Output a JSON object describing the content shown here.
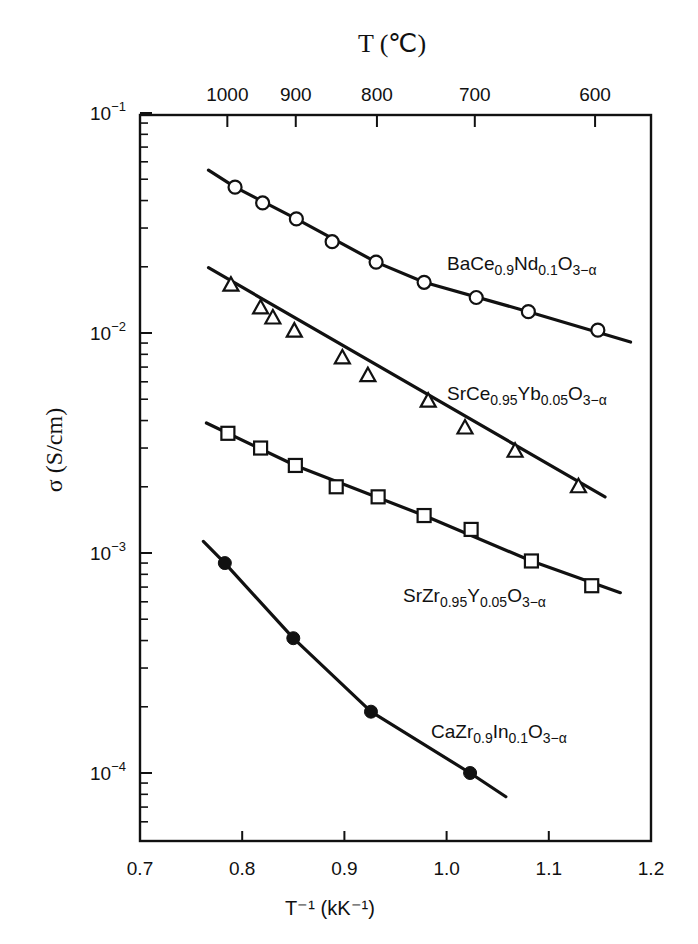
{
  "chart_data": {
    "type": "scatter",
    "title": "",
    "xlabel": "T⁻¹ (kK⁻¹)",
    "ylabel": "σ (S/cm)",
    "top_xlabel": "T (℃)",
    "xlim": [
      0.7,
      1.2
    ],
    "ylim": [
      5e-05,
      0.1
    ],
    "yscale": "log",
    "grid": false,
    "x_ticks": [
      0.7,
      0.8,
      0.9,
      1.0,
      1.1,
      1.2
    ],
    "x_tick_labels": [
      "0.7",
      "0.8",
      "0.9",
      "1.0",
      "1.1",
      "1.2"
    ],
    "y_ticks": [
      0.1,
      0.01,
      0.001,
      0.0001
    ],
    "y_tick_labels": [
      {
        "base": "10",
        "exp": "−1"
      },
      {
        "base": "10",
        "exp": "−2"
      },
      {
        "base": "10",
        "exp": "−3"
      },
      {
        "base": "10",
        "exp": "−4"
      }
    ],
    "top_ticks_celsius": [
      1000,
      900,
      800,
      700,
      600
    ],
    "top_tick_labels": [
      "1000",
      "900",
      "800",
      "700",
      "600"
    ],
    "series": [
      {
        "name": "BaCe0.9Nd0.1O3-α",
        "label_parts": [
          [
            "BaCe",
            ""
          ],
          [
            "0.9",
            "sub"
          ],
          [
            "Nd",
            ""
          ],
          [
            "0.1",
            "sub"
          ],
          [
            "O",
            ""
          ],
          [
            "3−α",
            "sub"
          ]
        ],
        "marker": "open-circle",
        "x": [
          0.793,
          0.82,
          0.853,
          0.888,
          0.931,
          0.978,
          1.029,
          1.08,
          1.148
        ],
        "y": [
          0.046,
          0.039,
          0.033,
          0.026,
          0.021,
          0.017,
          0.0145,
          0.0125,
          0.0103
        ],
        "line": [
          [
            0.767,
            0.055
          ],
          [
            0.793,
            0.046
          ],
          [
            0.853,
            0.033
          ],
          [
            0.931,
            0.021
          ],
          [
            0.978,
            0.017
          ],
          [
            1.08,
            0.0125
          ],
          [
            1.18,
            0.0091
          ]
        ]
      },
      {
        "name": "SrCe0.95Yb0.05O3-α",
        "label_parts": [
          [
            "SrCe",
            ""
          ],
          [
            "0.95",
            "sub"
          ],
          [
            "Yb",
            ""
          ],
          [
            "0.05",
            "sub"
          ],
          [
            "O",
            ""
          ],
          [
            "3−α",
            "sub"
          ]
        ],
        "marker": "open-triangle",
        "x": [
          0.789,
          0.818,
          0.83,
          0.851,
          0.898,
          0.923,
          0.982,
          1.018,
          1.067,
          1.129
        ],
        "y": [
          0.0165,
          0.013,
          0.0117,
          0.0102,
          0.0077,
          0.0064,
          0.0049,
          0.0037,
          0.0029,
          0.002
        ],
        "line": [
          [
            0.767,
            0.0198
          ],
          [
            1.155,
            0.0018
          ]
        ]
      },
      {
        "name": "SrZr0.95Y0.05O3-α",
        "label_parts": [
          [
            "SrZr",
            ""
          ],
          [
            "0.95",
            "sub"
          ],
          [
            "Y",
            ""
          ],
          [
            "0.05",
            "sub"
          ],
          [
            "O",
            ""
          ],
          [
            "3−α",
            "sub"
          ]
        ],
        "marker": "open-square",
        "x": [
          0.786,
          0.818,
          0.852,
          0.892,
          0.933,
          0.978,
          1.024,
          1.083,
          1.142
        ],
        "y": [
          0.0035,
          0.003,
          0.0025,
          0.002,
          0.0018,
          0.00148,
          0.00128,
          0.00092,
          0.00071
        ],
        "line": [
          [
            0.765,
            0.0039
          ],
          [
            0.852,
            0.0025
          ],
          [
            0.978,
            0.00148
          ],
          [
            1.083,
            0.00092
          ],
          [
            1.17,
            0.00066
          ]
        ]
      },
      {
        "name": "CaZr0.9In0.1O3-α",
        "label_parts": [
          [
            "CaZr",
            ""
          ],
          [
            "0.9",
            "sub"
          ],
          [
            "In",
            ""
          ],
          [
            "0.1",
            "sub"
          ],
          [
            "O",
            ""
          ],
          [
            "3−α",
            "sub"
          ]
        ],
        "marker": "filled-circle",
        "x": [
          0.783,
          0.85,
          0.926,
          1.023
        ],
        "y": [
          0.0009,
          0.00041,
          0.00019,
          0.0001
        ],
        "line": [
          [
            0.762,
            0.00113
          ],
          [
            0.783,
            0.0009
          ],
          [
            0.85,
            0.00041
          ],
          [
            0.926,
            0.00019
          ],
          [
            1.023,
            0.0001
          ],
          [
            1.058,
            7.8e-05
          ]
        ]
      }
    ],
    "series_label_positions": [
      {
        "x": 447,
        "y": 270
      },
      {
        "x": 447,
        "y": 400
      },
      {
        "x": 403,
        "y": 602
      },
      {
        "x": 431,
        "y": 738
      }
    ]
  }
}
